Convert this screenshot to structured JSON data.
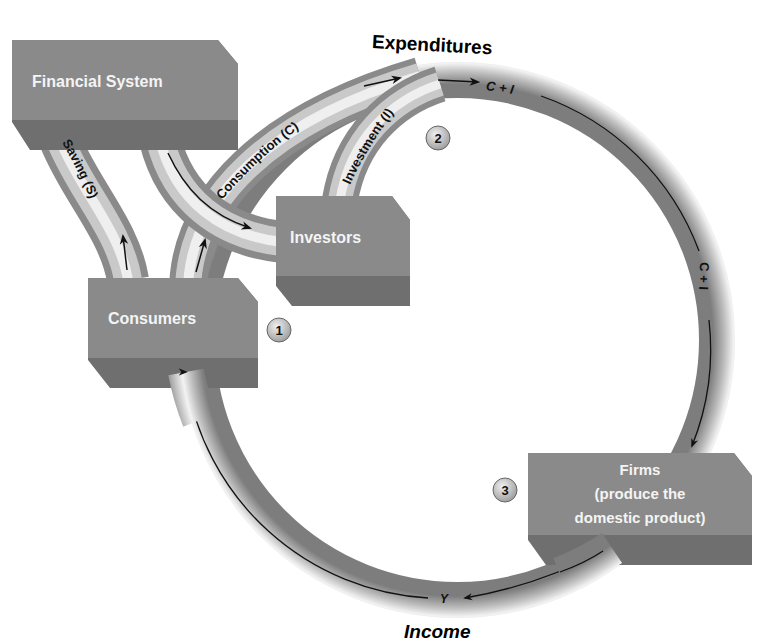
{
  "diagram": {
    "headings": {
      "top": "Expenditures",
      "bottom": "Income"
    },
    "nodes": {
      "financial_system": {
        "label": "Financial System"
      },
      "investors": {
        "label": "Investors"
      },
      "consumers": {
        "label": "Consumers"
      },
      "firms": {
        "label_lines": [
          "Firms",
          "(produce the",
          "domestic product)"
        ]
      }
    },
    "flows": {
      "saving": "Saving (S)",
      "consumption": "Consumption (C)",
      "investment": "Investment (I)",
      "c_plus_i_top": "C + I",
      "c_plus_i_right": "C + I",
      "income_y": "Y"
    },
    "step_markers": [
      "1",
      "2",
      "3"
    ],
    "colors": {
      "box_face": "#8a8a8a",
      "box_shadow": "#6f6f6f",
      "tube_light": "#f2f2f2",
      "tube_dark": "#8c8c8c",
      "marker_fill": "#c8c8c8"
    }
  }
}
